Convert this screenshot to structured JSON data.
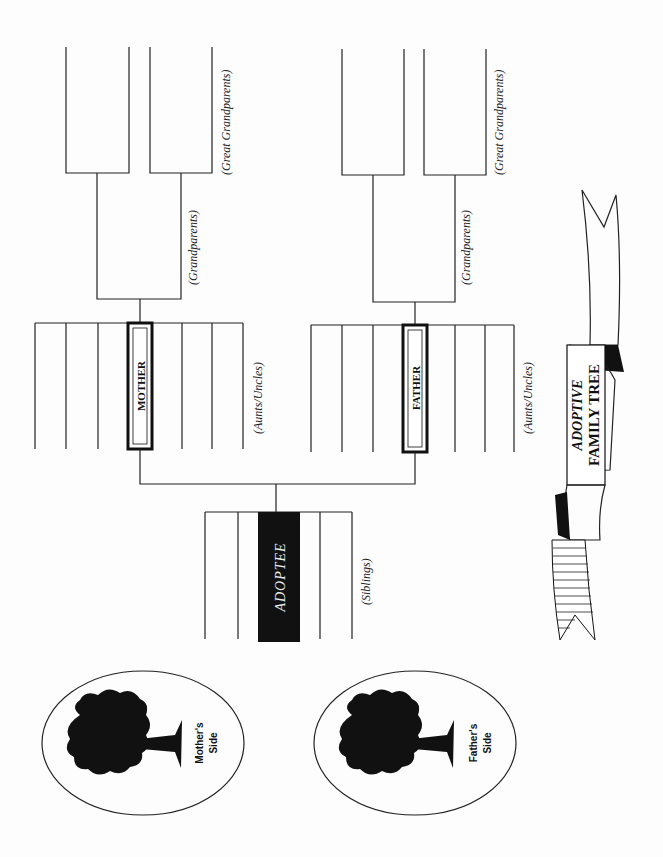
{
  "title": {
    "line1": "ADOPTIVE",
    "line2": "FAMILY TREE"
  },
  "people": {
    "adoptee": "ADOPTEE",
    "mother": "MOTHER",
    "father": "FATHER"
  },
  "labels": {
    "siblings": "(Siblings)",
    "aunts_uncles": "(Aunts/Uncles)",
    "grandparents": "(Grandparents)",
    "great_grandparents": "(Great Grandparents)"
  },
  "emblems": {
    "mother": {
      "line1": "Mother's",
      "line2": "Side"
    },
    "father": {
      "line1": "Father's",
      "line2": "Side"
    }
  },
  "colors": {
    "ink": "#222222",
    "paper": "#fdfdfd"
  }
}
